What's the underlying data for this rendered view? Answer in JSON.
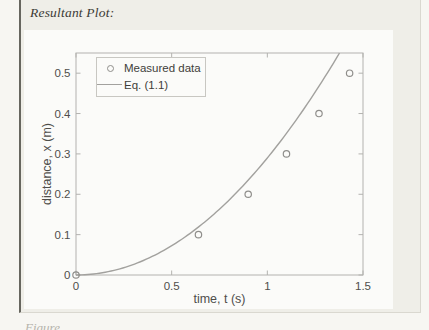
{
  "page": {
    "heading": "Resultant Plot:",
    "caption_partial": "Figure"
  },
  "chart_data": {
    "type": "scatter",
    "title": "",
    "xlabel": "time, t (s)",
    "ylabel": "distance, x (m)",
    "xlim": [
      0,
      1.5
    ],
    "ylim": [
      0,
      0.55
    ],
    "x_tick_values": [
      0,
      0.5,
      1,
      1.5
    ],
    "x_tick_labels": [
      "0",
      "0.5",
      "1",
      "1.5"
    ],
    "y_tick_values": [
      0,
      0.1,
      0.2,
      0.3,
      0.4,
      0.5
    ],
    "y_tick_labels": [
      "0",
      "0.1",
      "0.2",
      "0.3",
      "0.4",
      "0.5"
    ],
    "grid": false,
    "legend_position": "northwest",
    "series": [
      {
        "name": "Measured data",
        "type": "scatter",
        "marker": "circle",
        "x": [
          0,
          0.64,
          0.9,
          1.1,
          1.27,
          1.43
        ],
        "y": [
          0,
          0.1,
          0.2,
          0.3,
          0.4,
          0.5
        ]
      },
      {
        "name": "Eq. (1.1)",
        "type": "line",
        "equation": "x = 0.29*t^2",
        "coefficient": 0.29
      }
    ]
  },
  "colors": {
    "page_bg": "#f7f6f2",
    "panel_bg": "#efeee8",
    "panel_rule": "#67665f",
    "panel_border": "#dad8d0",
    "figure_bg": "#fbfbf9",
    "axis_line": "#b3b2af",
    "tick_text": "#4f4e4b",
    "series_gray": "#8f8e8b",
    "curve_gray": "#a2a19e",
    "legend_border": "#c8c7c2",
    "heading_text": "#3b3a35",
    "caption_text": "#b5b3ab"
  }
}
